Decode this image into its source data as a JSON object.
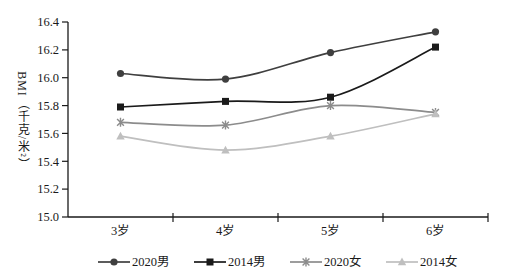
{
  "chart_data": {
    "type": "line",
    "title": "",
    "xlabel": "",
    "ylabel": "BMI（千克/米²）",
    "categories": [
      "3岁",
      "4岁",
      "5岁",
      "6岁"
    ],
    "series": [
      {
        "name": "2020男",
        "marker": "circle",
        "color": "#3f3f3f",
        "values": [
          16.03,
          15.99,
          16.18,
          16.33
        ]
      },
      {
        "name": "2014男",
        "marker": "square",
        "color": "#1a1a1a",
        "values": [
          15.79,
          15.83,
          15.86,
          16.22
        ]
      },
      {
        "name": "2020女",
        "marker": "asterisk",
        "color": "#8c8c8c",
        "values": [
          15.68,
          15.66,
          15.8,
          15.75
        ]
      },
      {
        "name": "2014女",
        "marker": "triangle",
        "color": "#bfbfbf",
        "values": [
          15.58,
          15.48,
          15.58,
          15.74
        ]
      }
    ],
    "ylim": [
      15.0,
      16.4
    ],
    "ytick_step": 0.2,
    "ytick_labels": [
      "15.0",
      "15.2",
      "15.4",
      "15.6",
      "15.8",
      "16.0",
      "16.2",
      "16.4"
    ],
    "axis_color": "#1a1a1a",
    "grid": false,
    "smooth": true,
    "legend_position": "bottom"
  }
}
